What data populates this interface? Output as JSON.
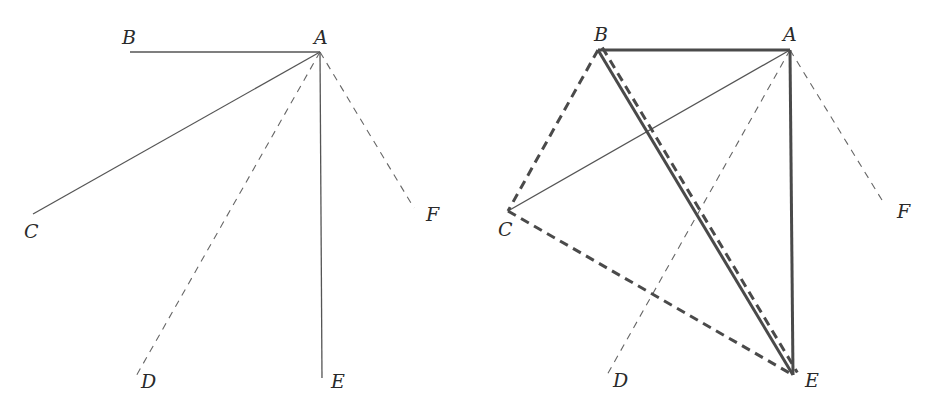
{
  "figures": [
    {
      "id": "left",
      "points": {
        "A": {
          "x": 320,
          "y": 52,
          "label": "A",
          "lx": 314,
          "ly": 44
        },
        "B": {
          "x": 130,
          "y": 52,
          "label": "B",
          "lx": 122,
          "ly": 44
        },
        "C": {
          "x": 33,
          "y": 214,
          "label": "C",
          "lx": 24,
          "ly": 238
        },
        "D": {
          "x": 135,
          "y": 378,
          "label": "D",
          "lx": 141,
          "ly": 388
        },
        "E": {
          "x": 322,
          "y": 378,
          "label": "E",
          "lx": 331,
          "ly": 388
        },
        "F": {
          "x": 414,
          "y": 208,
          "label": "F",
          "lx": 426,
          "ly": 221
        }
      },
      "segments": [
        {
          "from": "A",
          "to": "B",
          "style": "solid-thin"
        },
        {
          "from": "A",
          "to": "C",
          "style": "solid-thin"
        },
        {
          "from": "A",
          "to": "D",
          "style": "dashed-thin"
        },
        {
          "from": "A",
          "to": "E",
          "style": "solid-thin"
        },
        {
          "from": "A",
          "to": "F",
          "style": "dashed-thin"
        }
      ]
    },
    {
      "id": "right",
      "points": {
        "A": {
          "x": 790,
          "y": 50,
          "label": "A",
          "lx": 783,
          "ly": 41
        },
        "B": {
          "x": 598,
          "y": 50,
          "label": "B",
          "lx": 594,
          "ly": 41
        },
        "C": {
          "x": 508,
          "y": 211,
          "label": "C",
          "lx": 498,
          "ly": 236
        },
        "D": {
          "x": 607,
          "y": 375,
          "label": "D",
          "lx": 613,
          "ly": 387
        },
        "E": {
          "x": 793,
          "y": 375,
          "label": "E",
          "lx": 805,
          "ly": 387
        },
        "F": {
          "x": 885,
          "y": 205,
          "label": "F",
          "lx": 897,
          "ly": 218
        }
      },
      "segments": [
        {
          "from": "A",
          "to": "C",
          "style": "solid-thin"
        },
        {
          "from": "A",
          "to": "D",
          "style": "dashed-thin"
        },
        {
          "from": "A",
          "to": "F",
          "style": "dashed-thin"
        },
        {
          "from": "B",
          "to": "C",
          "style": "dashed-thick"
        },
        {
          "from": "C",
          "to": "E",
          "style": "dashed-thick"
        },
        {
          "from": "B",
          "to": "E",
          "style": "dashed-thick",
          "offset": -5
        },
        {
          "from": "A",
          "to": "B",
          "style": "solid-thick"
        },
        {
          "from": "A",
          "to": "E",
          "style": "solid-thick"
        },
        {
          "from": "B",
          "to": "E",
          "style": "solid-thick"
        }
      ]
    }
  ],
  "styles": {
    "solid-thin": {
      "stroke": "#555555",
      "width": 1.3,
      "dash": ""
    },
    "dashed-thin": {
      "stroke": "#666666",
      "width": 1.1,
      "dash": "7 6"
    },
    "solid-thick": {
      "stroke": "#4a4a4a",
      "width": 3,
      "dash": ""
    },
    "dashed-thick": {
      "stroke": "#4a4a4a",
      "width": 3,
      "dash": "9 6"
    }
  }
}
